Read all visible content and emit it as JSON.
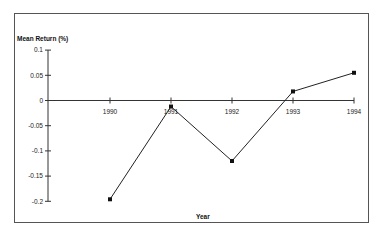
{
  "chart_data": {
    "type": "line",
    "title": "",
    "xlabel": "Year",
    "ylabel": "Mean Return (%)",
    "categories": [
      "1990",
      "1991",
      "1992",
      "1993",
      "1994"
    ],
    "series": [
      {
        "name": "Mean Return",
        "values": [
          -0.196,
          -0.012,
          -0.12,
          0.018,
          0.055
        ]
      }
    ],
    "yticks": [
      "0.1",
      "0.05",
      "0",
      "-0.05",
      "-0.1",
      "-0.15",
      "-0.2"
    ],
    "ytick_values": [
      0.1,
      0.05,
      0,
      -0.05,
      -0.1,
      -0.15,
      -0.2
    ],
    "ylim": [
      -0.2,
      0.1
    ],
    "grid": false,
    "legend": false,
    "marker": "square",
    "colors": {
      "line": "#222222",
      "marker": "#111111",
      "axis": "#333333",
      "frame": "#555555"
    }
  }
}
